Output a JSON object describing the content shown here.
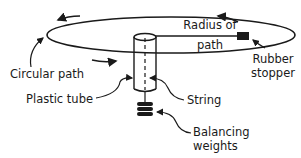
{
  "diagram": {
    "labels": {
      "radius_line1": "Radius of",
      "radius_line2": "path",
      "circular_path": "Circular path",
      "rubber_stopper_line1": "Rubber",
      "rubber_stopper_line2": "stopper",
      "plastic_tube": "Plastic tube",
      "string": "String",
      "balancing_weights_line1": "Balancing",
      "balancing_weights_line2": "weights"
    },
    "colors": {
      "ink": "#1a1a1a",
      "background": "#ffffff"
    }
  }
}
